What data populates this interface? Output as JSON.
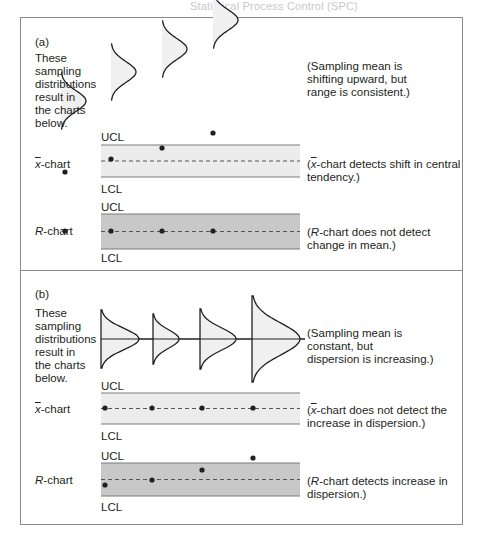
{
  "header": {
    "running_title": "Statistical Process Control (SPC)",
    "page_number": ""
  },
  "chart_data": {
    "type": "diagram",
    "panels": [
      {
        "id": "a",
        "part_label": "(a)",
        "description": "These\nsampling\ndistributions\nresult in\nthe charts\nbelow.",
        "distribution_note": "(Sampling mean is\nshifting upward, but\nrange is consistent.)",
        "distributions": [
          {
            "x": 61,
            "mean_y": 101,
            "spread": 28,
            "width": 25
          },
          {
            "x": 111,
            "mean_y": 72,
            "spread": 28,
            "width": 25
          },
          {
            "x": 162,
            "mean_y": 49,
            "spread": 28,
            "width": 25
          },
          {
            "x": 213,
            "mean_y": 20,
            "spread": 28,
            "width": 25
          }
        ],
        "xbar_chart": {
          "label": "x-chart",
          "ucl_label": "UCL",
          "lcl_label": "LCL",
          "note": "(x-chart detects shift in central\ntendency.)",
          "points": [
            {
              "x": 65,
              "y": 172
            },
            {
              "x": 111,
              "y": 159
            },
            {
              "x": 162,
              "y": 148
            },
            {
              "x": 213,
              "y": 133
            }
          ]
        },
        "r_chart": {
          "label": "R-chart",
          "ucl_label": "UCL",
          "lcl_label": "LCL",
          "note": "(R-chart does not detect\nchange in mean.)",
          "points": [
            {
              "x": 65,
              "y": 231
            },
            {
              "x": 111,
              "y": 231
            },
            {
              "x": 162,
              "y": 231
            },
            {
              "x": 213,
              "y": 231
            }
          ]
        }
      },
      {
        "id": "b",
        "part_label": "(b)",
        "description": "These\nsampling\ndistributions\nresult in\nthe charts\nbelow.",
        "distribution_note": "(Sampling mean is\nconstant, but\ndispersion is increasing.)",
        "distributions": [
          {
            "x": 101,
            "mean_y": 339,
            "spread": 29,
            "width": 38
          },
          {
            "x": 153,
            "mean_y": 339,
            "spread": 25,
            "width": 26
          },
          {
            "x": 200,
            "mean_y": 339,
            "spread": 30,
            "width": 36
          },
          {
            "x": 252,
            "mean_y": 339,
            "spread": 43,
            "width": 48
          }
        ],
        "xbar_chart": {
          "label": "x-chart",
          "ucl_label": "UCL",
          "lcl_label": "LCL",
          "note": "(x-chart does not detect the\nincrease in dispersion.)",
          "points": [
            {
              "x": 105,
              "y": 408
            },
            {
              "x": 152,
              "y": 408
            },
            {
              "x": 202,
              "y": 408
            },
            {
              "x": 253,
              "y": 408
            }
          ]
        },
        "r_chart": {
          "label": "R-chart",
          "ucl_label": "UCL",
          "lcl_label": "LCL",
          "note": "(R-chart detects increase in\ndispersion.)",
          "points": [
            {
              "x": 105,
              "y": 485
            },
            {
              "x": 152,
              "y": 480
            },
            {
              "x": 202,
              "y": 470
            },
            {
              "x": 253,
              "y": 458
            }
          ]
        }
      }
    ],
    "colors": {
      "xbar_band": "#ececec",
      "r_band": "#c8c8c8",
      "curve_fill": "#f0f0f0",
      "line": "#231f20",
      "limit_line": "#7a7a7a"
    }
  }
}
